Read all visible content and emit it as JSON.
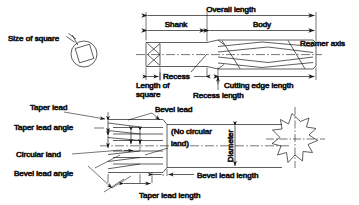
{
  "diagram": {
    "colors": {
      "line": "#1a1a1a",
      "text": "#1a1a1a",
      "background": "#ffffff",
      "shading": "#d8d8d8"
    },
    "views": {
      "square_detail": {
        "label": "Size of square",
        "shape": "circle-with-inscribed-square"
      },
      "main_view": {
        "labels": {
          "overall_length": "Overall length",
          "shank": "Shank",
          "body": "Body",
          "reamer_axis": "Reamer axis",
          "recess": "Recess",
          "length_of_square_line1": "Length of",
          "length_of_square_line2": "square",
          "recess_length": "Recess length",
          "cutting_edge_length": "Cutting edge length"
        }
      },
      "lead_detail": {
        "labels": {
          "taper_lead": "Taper lead",
          "taper_lead_angle": "Taper lead angle",
          "circular_land": "Circular land",
          "bevel_lead_angle": "Bevel lead angle",
          "bevel_lead": "Bevel lead",
          "no_circular_land_line1": "(No circular",
          "no_circular_land_line2": "land)",
          "diameter": "Diameter",
          "bevel_lead_length": "Bevel lead length",
          "taper_lead_length": "Taper lead length"
        }
      },
      "section_view": {
        "label": "",
        "shape": "fluted-star-cross-section",
        "flutes": 8
      }
    }
  }
}
